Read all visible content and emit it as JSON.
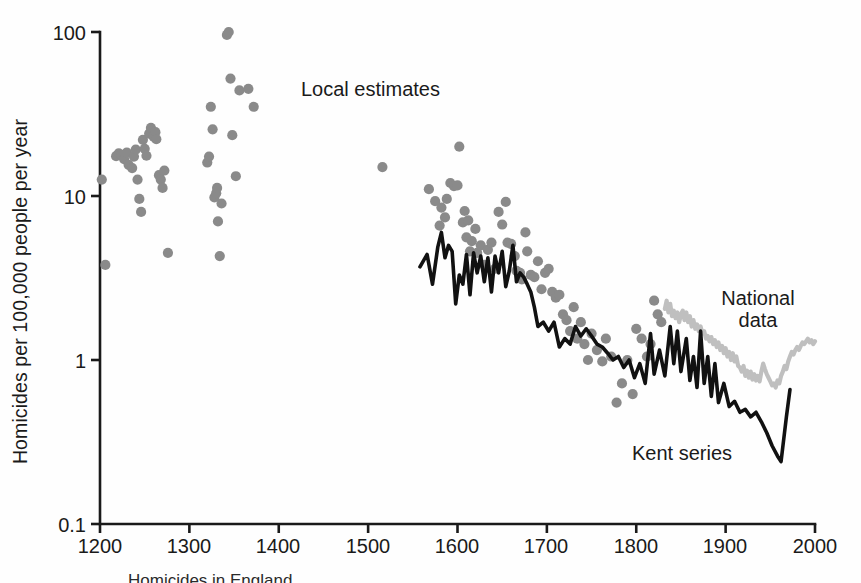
{
  "figure": {
    "background": "#fefefe",
    "ink": "#1a1a1a",
    "dot_color": "#8a8a8a",
    "kent_color": "#111111",
    "national_color": "#bfbfbf",
    "caption": "Homicides in England"
  },
  "chart_data": {
    "type": "scatter",
    "title": "",
    "subtitle": "",
    "xlabel": "",
    "ylabel": "Homicides per 100,000 people per year",
    "xlim": [
      1150,
      2030
    ],
    "ylim": [
      0.1,
      130
    ],
    "yscale": "log",
    "xscale": "linear",
    "grid": false,
    "legend_position": "inline-annotations",
    "xticks": [
      1200,
      1300,
      1400,
      1500,
      1600,
      1700,
      1800,
      1900,
      2000
    ],
    "xticklabels": [
      "1200",
      "1300",
      "1400",
      "1500",
      "1600",
      "1700",
      "1800",
      "1900",
      "2000"
    ],
    "yticks": [
      0.1,
      1,
      10,
      100
    ],
    "yticklabels": [
      "0.1",
      "1",
      "10",
      "100"
    ],
    "annotations": [
      {
        "name": "local-estimates",
        "text": "Local estimates",
        "x": 1391,
        "y": 42.0
      },
      {
        "name": "national-data",
        "line1": "National",
        "line2": "data",
        "x": 1906,
        "y": 2.45
      },
      {
        "name": "kent-series",
        "text": "Kent series",
        "x": 1808,
        "y": 0.42
      }
    ],
    "series": [
      {
        "name": "Local estimates",
        "type": "scatter",
        "color": "#8a8a8a",
        "marker": "circle",
        "points": [
          [
            1202,
            12.6
          ],
          [
            1206,
            3.8
          ],
          [
            1218,
            17.5
          ],
          [
            1221,
            18.2
          ],
          [
            1224,
            17.8
          ],
          [
            1227,
            16.8
          ],
          [
            1230,
            18.4
          ],
          [
            1232,
            15.5
          ],
          [
            1236,
            14.8
          ],
          [
            1238,
            17.4
          ],
          [
            1240,
            19.2
          ],
          [
            1242,
            12.6
          ],
          [
            1244,
            9.6
          ],
          [
            1246,
            8.0
          ],
          [
            1248,
            22.0
          ],
          [
            1250,
            19.4
          ],
          [
            1252,
            17.6
          ],
          [
            1255,
            24.0
          ],
          [
            1257,
            26.0
          ],
          [
            1260,
            23.0
          ],
          [
            1262,
            24.5
          ],
          [
            1263,
            22.2
          ],
          [
            1266,
            13.4
          ],
          [
            1268,
            12.6
          ],
          [
            1270,
            11.2
          ],
          [
            1272,
            14.3
          ],
          [
            1276,
            4.5
          ],
          [
            1320,
            16.0
          ],
          [
            1322,
            17.4
          ],
          [
            1324,
            35.0
          ],
          [
            1326,
            25.5
          ],
          [
            1328,
            9.8
          ],
          [
            1330,
            10.4
          ],
          [
            1331,
            11.2
          ],
          [
            1332,
            7.0
          ],
          [
            1334,
            4.3
          ],
          [
            1336,
            9.0
          ],
          [
            1342,
            96.0
          ],
          [
            1344,
            100.0
          ],
          [
            1346,
            52.0
          ],
          [
            1348,
            23.5
          ],
          [
            1352,
            13.2
          ],
          [
            1356,
            44.0
          ],
          [
            1366,
            45.0
          ],
          [
            1372,
            35.0
          ],
          [
            1516,
            15.0
          ],
          [
            1568,
            11.0
          ],
          [
            1575,
            9.3
          ],
          [
            1580,
            6.6
          ],
          [
            1582,
            8.5
          ],
          [
            1586,
            7.4
          ],
          [
            1588,
            9.6
          ],
          [
            1592,
            12.0
          ],
          [
            1596,
            11.5
          ],
          [
            1600,
            11.6
          ],
          [
            1602,
            20.0
          ],
          [
            1606,
            6.9
          ],
          [
            1608,
            8.1
          ],
          [
            1610,
            5.6
          ],
          [
            1612,
            7.1
          ],
          [
            1614,
            4.6
          ],
          [
            1616,
            5.3
          ],
          [
            1620,
            6.3
          ],
          [
            1622,
            4.5
          ],
          [
            1626,
            5.0
          ],
          [
            1630,
            3.8
          ],
          [
            1634,
            4.7
          ],
          [
            1638,
            5.2
          ],
          [
            1642,
            3.6
          ],
          [
            1646,
            8.0
          ],
          [
            1650,
            6.7
          ],
          [
            1654,
            9.2
          ],
          [
            1656,
            5.2
          ],
          [
            1660,
            5.1
          ],
          [
            1664,
            4.3
          ],
          [
            1666,
            3.5
          ],
          [
            1670,
            3.4
          ],
          [
            1672,
            3.1
          ],
          [
            1676,
            6.0
          ],
          [
            1678,
            4.6
          ],
          [
            1682,
            3.3
          ],
          [
            1686,
            3.2
          ],
          [
            1690,
            4.0
          ],
          [
            1694,
            2.7
          ],
          [
            1698,
            3.4
          ],
          [
            1702,
            3.6
          ],
          [
            1706,
            2.6
          ],
          [
            1710,
            2.4
          ],
          [
            1714,
            2.5
          ],
          [
            1718,
            1.9
          ],
          [
            1722,
            1.75
          ],
          [
            1726,
            1.5
          ],
          [
            1730,
            2.1
          ],
          [
            1734,
            1.35
          ],
          [
            1738,
            1.7
          ],
          [
            1742,
            1.25
          ],
          [
            1746,
            1.0
          ],
          [
            1750,
            1.45
          ],
          [
            1756,
            1.15
          ],
          [
            1762,
            0.98
          ],
          [
            1766,
            1.35
          ],
          [
            1772,
            1.05
          ],
          [
            1778,
            0.55
          ],
          [
            1784,
            0.72
          ],
          [
            1790,
            1.0
          ],
          [
            1796,
            0.62
          ],
          [
            1800,
            1.55
          ],
          [
            1806,
            1.35
          ],
          [
            1812,
            1.05
          ],
          [
            1816,
            1.25
          ],
          [
            1820,
            2.3
          ],
          [
            1824,
            1.9
          ],
          [
            1828,
            1.7
          ]
        ]
      },
      {
        "name": "Kent series",
        "type": "line",
        "color": "#111111",
        "points": [
          [
            1558,
            3.7
          ],
          [
            1566,
            4.4
          ],
          [
            1572,
            2.9
          ],
          [
            1578,
            4.9
          ],
          [
            1582,
            6.0
          ],
          [
            1586,
            4.2
          ],
          [
            1590,
            5.0
          ],
          [
            1594,
            4.6
          ],
          [
            1598,
            2.2
          ],
          [
            1602,
            3.3
          ],
          [
            1606,
            2.9
          ],
          [
            1610,
            4.4
          ],
          [
            1614,
            2.5
          ],
          [
            1618,
            4.5
          ],
          [
            1622,
            3.4
          ],
          [
            1626,
            4.3
          ],
          [
            1630,
            3.0
          ],
          [
            1634,
            4.2
          ],
          [
            1638,
            2.6
          ],
          [
            1642,
            4.3
          ],
          [
            1646,
            3.4
          ],
          [
            1650,
            4.6
          ],
          [
            1654,
            2.8
          ],
          [
            1658,
            3.5
          ],
          [
            1662,
            5.0
          ],
          [
            1666,
            3.0
          ],
          [
            1670,
            3.4
          ],
          [
            1674,
            3.2
          ],
          [
            1678,
            2.9
          ],
          [
            1682,
            2.6
          ],
          [
            1686,
            2.1
          ],
          [
            1690,
            1.6
          ],
          [
            1696,
            1.7
          ],
          [
            1702,
            1.5
          ],
          [
            1708,
            1.7
          ],
          [
            1714,
            1.2
          ],
          [
            1720,
            1.35
          ],
          [
            1726,
            1.25
          ],
          [
            1732,
            1.6
          ],
          [
            1738,
            1.4
          ],
          [
            1744,
            1.55
          ],
          [
            1750,
            1.4
          ],
          [
            1756,
            1.25
          ],
          [
            1762,
            1.2
          ],
          [
            1768,
            1.1
          ],
          [
            1774,
            1.0
          ],
          [
            1780,
            1.05
          ],
          [
            1786,
            0.9
          ],
          [
            1792,
            1.0
          ],
          [
            1798,
            0.78
          ],
          [
            1804,
            0.95
          ],
          [
            1810,
            0.72
          ],
          [
            1816,
            1.45
          ],
          [
            1820,
            0.82
          ],
          [
            1826,
            1.15
          ],
          [
            1832,
            0.8
          ],
          [
            1838,
            1.6
          ],
          [
            1842,
            0.95
          ],
          [
            1846,
            1.5
          ],
          [
            1850,
            0.85
          ],
          [
            1856,
            1.35
          ],
          [
            1860,
            0.75
          ],
          [
            1864,
            1.05
          ],
          [
            1868,
            0.68
          ],
          [
            1872,
            1.5
          ],
          [
            1876,
            0.72
          ],
          [
            1880,
            1.05
          ],
          [
            1884,
            0.6
          ],
          [
            1888,
            0.95
          ],
          [
            1892,
            0.55
          ],
          [
            1898,
            0.72
          ],
          [
            1904,
            0.52
          ],
          [
            1910,
            0.56
          ],
          [
            1916,
            0.48
          ],
          [
            1922,
            0.5
          ],
          [
            1928,
            0.45
          ],
          [
            1934,
            0.48
          ],
          [
            1940,
            0.42
          ],
          [
            1946,
            0.36
          ],
          [
            1952,
            0.3
          ],
          [
            1958,
            0.26
          ],
          [
            1962,
            0.24
          ],
          [
            1968,
            0.45
          ],
          [
            1972,
            0.66
          ]
        ]
      },
      {
        "name": "National data",
        "type": "line",
        "color": "#bfbfbf",
        "points": [
          [
            1832,
            2.05
          ],
          [
            1834,
            2.3
          ],
          [
            1836,
            1.95
          ],
          [
            1838,
            2.2
          ],
          [
            1840,
            1.85
          ],
          [
            1842,
            2.0
          ],
          [
            1844,
            1.8
          ],
          [
            1846,
            1.95
          ],
          [
            1848,
            1.7
          ],
          [
            1850,
            1.9
          ],
          [
            1852,
            2.0
          ],
          [
            1854,
            1.75
          ],
          [
            1856,
            1.95
          ],
          [
            1858,
            1.7
          ],
          [
            1860,
            1.85
          ],
          [
            1862,
            1.6
          ],
          [
            1864,
            1.75
          ],
          [
            1866,
            1.55
          ],
          [
            1868,
            1.65
          ],
          [
            1870,
            1.5
          ],
          [
            1872,
            1.6
          ],
          [
            1874,
            1.45
          ],
          [
            1876,
            1.5
          ],
          [
            1878,
            1.35
          ],
          [
            1880,
            1.4
          ],
          [
            1882,
            1.3
          ],
          [
            1884,
            1.38
          ],
          [
            1886,
            1.25
          ],
          [
            1888,
            1.32
          ],
          [
            1890,
            1.2
          ],
          [
            1892,
            1.28
          ],
          [
            1894,
            1.15
          ],
          [
            1896,
            1.22
          ],
          [
            1898,
            1.1
          ],
          [
            1900,
            1.18
          ],
          [
            1902,
            1.05
          ],
          [
            1904,
            1.12
          ],
          [
            1906,
            1.0
          ],
          [
            1908,
            1.1
          ],
          [
            1910,
            0.98
          ],
          [
            1912,
            1.05
          ],
          [
            1914,
            0.92
          ],
          [
            1916,
            0.9
          ],
          [
            1918,
            0.85
          ],
          [
            1920,
            0.92
          ],
          [
            1922,
            0.8
          ],
          [
            1924,
            0.86
          ],
          [
            1926,
            0.78
          ],
          [
            1928,
            0.85
          ],
          [
            1930,
            0.76
          ],
          [
            1932,
            0.82
          ],
          [
            1934,
            0.75
          ],
          [
            1936,
            0.8
          ],
          [
            1938,
            0.74
          ],
          [
            1940,
            0.85
          ],
          [
            1942,
            0.95
          ],
          [
            1944,
            0.88
          ],
          [
            1946,
            0.82
          ],
          [
            1948,
            0.78
          ],
          [
            1950,
            0.74
          ],
          [
            1952,
            0.7
          ],
          [
            1954,
            0.72
          ],
          [
            1956,
            0.68
          ],
          [
            1958,
            0.75
          ],
          [
            1960,
            0.72
          ],
          [
            1962,
            0.8
          ],
          [
            1964,
            0.85
          ],
          [
            1966,
            0.92
          ],
          [
            1968,
            0.88
          ],
          [
            1970,
            0.98
          ],
          [
            1972,
            1.05
          ],
          [
            1974,
            1.12
          ],
          [
            1976,
            1.08
          ],
          [
            1978,
            1.15
          ],
          [
            1980,
            1.2
          ],
          [
            1982,
            1.15
          ],
          [
            1984,
            1.22
          ],
          [
            1986,
            1.28
          ],
          [
            1988,
            1.25
          ],
          [
            1990,
            1.3
          ],
          [
            1992,
            1.35
          ],
          [
            1994,
            1.28
          ],
          [
            1996,
            1.32
          ],
          [
            1998,
            1.25
          ],
          [
            2000,
            1.3
          ]
        ]
      }
    ]
  }
}
